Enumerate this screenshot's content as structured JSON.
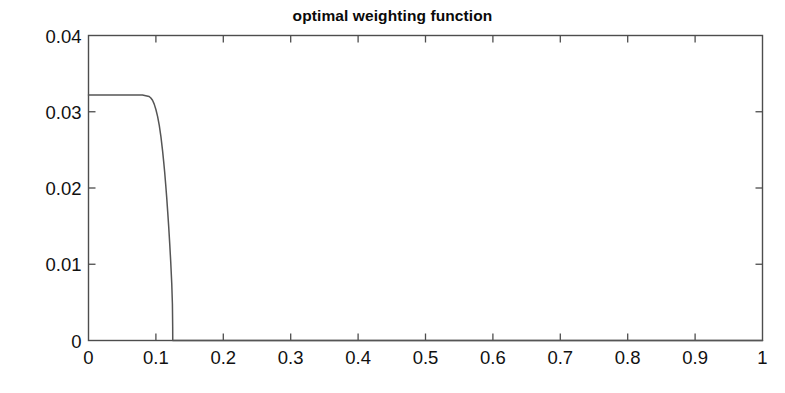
{
  "chart_data": {
    "type": "line",
    "title": "optimal weighting function",
    "xlabel": "",
    "ylabel": "",
    "xlim": [
      0,
      1
    ],
    "ylim": [
      0,
      0.04
    ],
    "grid": false,
    "legend": null,
    "legend_position": "none",
    "line_color": "#555555",
    "axis_color": "#4d4d4d",
    "background_color": "#ffffff",
    "xticks": [
      0,
      0.1,
      0.2,
      0.3,
      0.4,
      0.5,
      0.6,
      0.7,
      0.8,
      0.9,
      1
    ],
    "xtick_labels": [
      "0",
      "0.1",
      "0.2",
      "0.3",
      "0.4",
      "0.5",
      "0.6",
      "0.7",
      "0.8",
      "0.9",
      "1"
    ],
    "yticks": [
      0,
      0.01,
      0.02,
      0.03,
      0.04
    ],
    "ytick_labels": [
      "0",
      "0.01",
      "0.02",
      "0.03",
      "0.04"
    ],
    "plateau_value": 0.0322,
    "cutoff_x": 0.125,
    "annotations": [],
    "series": [
      {
        "name": "optimal weighting function",
        "x": [
          0,
          0.005,
          0.01,
          0.015,
          0.02,
          0.025,
          0.03,
          0.035,
          0.04,
          0.045,
          0.05,
          0.055,
          0.06,
          0.065,
          0.07,
          0.075,
          0.08,
          0.085,
          0.09,
          0.0925,
          0.095,
          0.0975,
          0.1,
          0.1025,
          0.105,
          0.1075,
          0.11,
          0.1115,
          0.113,
          0.1145,
          0.116,
          0.1175,
          0.119,
          0.1205,
          0.122,
          0.1235,
          0.1245,
          0.1249,
          0.125,
          0.13,
          0.2,
          0.3,
          0.4,
          0.5,
          0.6,
          0.7,
          0.8,
          0.9,
          1
        ],
        "y": [
          0.0322,
          0.0322,
          0.0322,
          0.0322,
          0.0322,
          0.0322,
          0.0322,
          0.0322,
          0.0322,
          0.0322,
          0.0322,
          0.0322,
          0.0322,
          0.0322,
          0.0322,
          0.0322,
          0.0322,
          0.0321,
          0.032,
          0.0318,
          0.0315,
          0.031,
          0.0303,
          0.0294,
          0.0282,
          0.0267,
          0.0248,
          0.0235,
          0.0221,
          0.0205,
          0.0188,
          0.0169,
          0.0149,
          0.0127,
          0.0103,
          0.0075,
          0.0048,
          0.0018,
          0.0,
          0.0,
          0.0,
          0.0,
          0.0,
          0.0,
          0.0,
          0.0,
          0.0,
          0.0,
          0.0
        ]
      }
    ]
  },
  "axes": {
    "title": "optimal weighting function"
  }
}
